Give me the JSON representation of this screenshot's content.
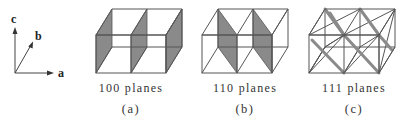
{
  "axes": {
    "labels": {
      "a": "a",
      "b": "b",
      "c": "c"
    }
  },
  "panels": [
    {
      "id": "a",
      "caption": "100 planes",
      "sublabel": "(a)"
    },
    {
      "id": "b",
      "caption": "110 planes",
      "sublabel": "(b)"
    },
    {
      "id": "c",
      "caption": "111 planes",
      "sublabel": "(c)"
    }
  ],
  "colors": {
    "edge": "#555555",
    "plane_fill": "#8a8a8a",
    "background": "#ffffff"
  }
}
